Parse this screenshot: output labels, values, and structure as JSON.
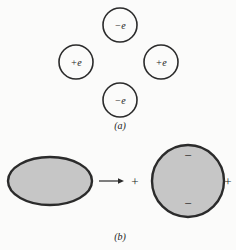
{
  "figure": {
    "title_implicit": "",
    "background_color": "#fbfbfa",
    "outline_color": "#2b2b2b",
    "fill_gray": "#c6c6c6",
    "panel_a": {
      "label": "(a)",
      "charges": [
        {
          "name": "top-charge",
          "label": "−e",
          "cx": 120,
          "cy": 25,
          "r": 17
        },
        {
          "name": "left-charge",
          "label": "+e",
          "cx": 76,
          "cy": 62,
          "r": 17
        },
        {
          "name": "right-charge",
          "label": "+e",
          "cx": 161,
          "cy": 62,
          "r": 17
        },
        {
          "name": "bottom-charge",
          "label": "−e",
          "cx": 120,
          "cy": 100,
          "r": 17
        }
      ]
    },
    "panel_b": {
      "label": "(b)",
      "ellipse": {
        "name": "oblate-body",
        "cx": 50,
        "cy": 181,
        "rx": 42,
        "ry": 24
      },
      "arrow": {
        "name": "transform-arrow",
        "x1": 99,
        "x2": 124,
        "y": 181
      },
      "plus_left": "+",
      "circle": {
        "name": "spherical-body",
        "cx": 188,
        "cy": 181,
        "r": 36
      },
      "inner_minus_top": "−",
      "inner_minus_bottom": "−",
      "plus_right": "+"
    }
  }
}
